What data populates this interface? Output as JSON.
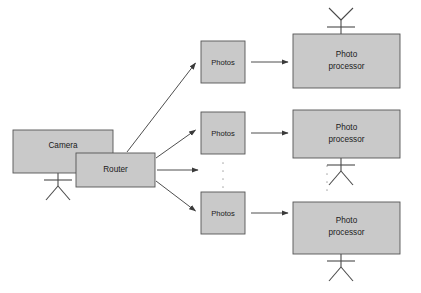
{
  "diagram": {
    "type": "block-flow-diagram",
    "background_color": "#ffffff",
    "box_fill_color": "#c9c9c9",
    "box_stroke_color": "#555555",
    "arrow_color": "#3a3a3a",
    "antenna_color": "#4a4a4a",
    "ellipsis_color": "#b0b0b0",
    "nodes": {
      "camera": {
        "label": "Camera",
        "x": 13,
        "y": 130,
        "width": 100,
        "height": 43
      },
      "router": {
        "label": "Router",
        "x": 76,
        "y": 153,
        "width": 79,
        "height": 34
      },
      "photos_top": {
        "label": "Photos",
        "x": 201,
        "y": 41,
        "width": 44,
        "height": 42
      },
      "photos_middle": {
        "label": "Photos",
        "x": 201,
        "y": 112,
        "width": 44,
        "height": 42
      },
      "photos_bottom": {
        "label": "Photos",
        "x": 201,
        "y": 192,
        "width": 44,
        "height": 42
      },
      "processor_top": {
        "label_line1": "Photo",
        "label_line2": "processor",
        "x": 293,
        "y": 34,
        "width": 107,
        "height": 54
      },
      "processor_middle": {
        "label_line1": "Photo",
        "label_line2": "processor",
        "x": 293,
        "y": 110,
        "width": 107,
        "height": 48
      },
      "processor_bottom": {
        "label_line1": "Photo",
        "label_line2": "processor",
        "x": 293,
        "y": 202,
        "width": 107,
        "height": 52
      }
    },
    "antennas": [
      {
        "name": "camera-antenna",
        "cx": 58,
        "cy": 173,
        "direction": "down"
      },
      {
        "name": "processor-top-antenna",
        "cx": 341,
        "cy": 34,
        "direction": "up"
      },
      {
        "name": "processor-middle-antenna",
        "cx": 341,
        "cy": 158,
        "direction": "down"
      },
      {
        "name": "processor-bottom-antenna",
        "cx": 341,
        "cy": 254,
        "direction": "down"
      }
    ],
    "ellipses": [
      {
        "name": "photos-ellipsis",
        "cx": 223,
        "y_start": 163,
        "y_end": 186,
        "dots": 4
      },
      {
        "name": "processor-ellipsis",
        "cx": 327,
        "y_start": 166,
        "y_end": 196,
        "dots": 5
      }
    ],
    "arrows": [
      {
        "name": "router-to-photos-top",
        "x1": 127,
        "y1": 152,
        "x2": 197,
        "y2": 62
      },
      {
        "name": "router-to-photos-middle",
        "x1": 156,
        "y1": 158,
        "x2": 197,
        "y2": 129
      },
      {
        "name": "router-to-photos-bottom",
        "x1": 156,
        "y1": 180,
        "x2": 197,
        "y2": 212
      },
      {
        "name": "router-to-processor-middle",
        "x1": 157,
        "y1": 170,
        "x2": 200,
        "y2": 170
      },
      {
        "name": "photos-top-to-processor-top",
        "x1": 250,
        "y1": 62,
        "x2": 289,
        "y2": 62
      },
      {
        "name": "photos-middle-to-processor-middle",
        "x1": 250,
        "y1": 133,
        "x2": 289,
        "y2": 133
      },
      {
        "name": "photos-bottom-to-processor-bottom",
        "x1": 250,
        "y1": 213,
        "x2": 289,
        "y2": 213
      }
    ],
    "caption": ""
  }
}
